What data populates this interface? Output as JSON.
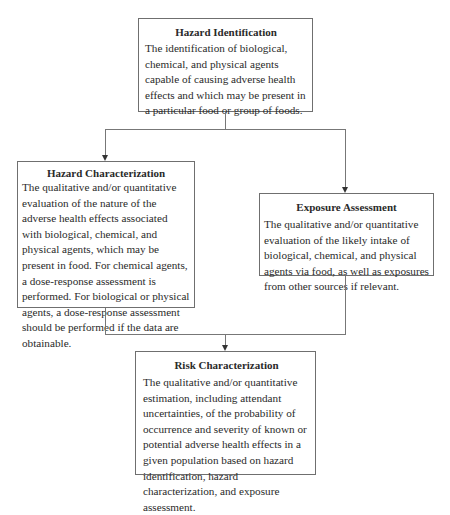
{
  "diagram": {
    "nodes": [
      {
        "id": "hazard-identification",
        "title": "Hazard Identification",
        "body": "The identification of biological, chemical, and physical agents capable of causing adverse health effects and which may be present in a particular food or group of foods."
      },
      {
        "id": "hazard-characterization",
        "title": "Hazard Characterization",
        "body": "The qualitative and/or quantitative evaluation of the nature of the adverse health effects associated with biological, chemical, and physical agents, which may be present in food. For chemical agents, a dose-response assessment is performed. For biological or physical agents, a dose-response assessment should be performed if the data are obtainable."
      },
      {
        "id": "exposure-assessment",
        "title": "Exposure Assessment",
        "body": "The qualitative and/or quantitative evaluation of the likely intake of biological, chemical, and physical agents via food, as well as exposures from other sources if relevant."
      },
      {
        "id": "risk-characterization",
        "title": "Risk Characterization",
        "body": "The qualitative and/or quantitative estimation, including attendant uncertainties, of the probability of occurrence and severity of known or potential adverse health effects in a given population based on hazard identification, hazard characterization, and exposure assessment."
      }
    ],
    "edges": [
      {
        "from": "hazard-identification",
        "to": "hazard-characterization"
      },
      {
        "from": "hazard-identification",
        "to": "exposure-assessment"
      },
      {
        "from": "hazard-characterization",
        "to": "risk-characterization"
      },
      {
        "from": "exposure-assessment",
        "to": "risk-characterization"
      }
    ]
  }
}
